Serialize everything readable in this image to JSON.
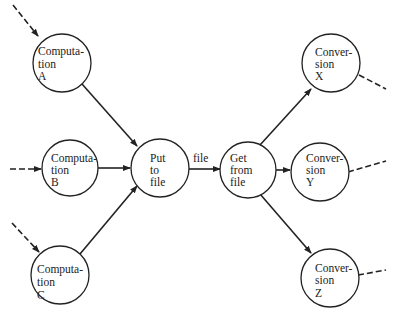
{
  "diagram": {
    "nodes": [
      {
        "id": "compA",
        "lines": [
          "Computa-",
          "tion",
          "A"
        ],
        "cx": 62,
        "cy": 63
      },
      {
        "id": "compB",
        "lines": [
          "Computa-",
          "tion",
          "B"
        ],
        "cx": 70,
        "cy": 165
      },
      {
        "id": "compC",
        "lines": [
          "Computa-",
          "tion",
          "C"
        ],
        "cx": 60,
        "cy": 275
      },
      {
        "id": "put",
        "lines": [
          "Put",
          "to",
          "file"
        ],
        "cx": 160,
        "cy": 165
      },
      {
        "id": "get",
        "lines": [
          "Get",
          "from",
          "file"
        ],
        "cx": 250,
        "cy": 168
      },
      {
        "id": "convX",
        "lines": [
          "Conver-",
          "sion",
          "X"
        ],
        "cx": 331,
        "cy": 63
      },
      {
        "id": "convY",
        "lines": [
          "Conver-",
          "sion",
          "Y"
        ],
        "cx": 320,
        "cy": 172
      },
      {
        "id": "convZ",
        "lines": [
          "Conver-",
          "sion",
          "Z"
        ],
        "cx": 330,
        "cy": 276
      }
    ],
    "edges": [
      {
        "from": "compA",
        "to": "put",
        "style": "solid"
      },
      {
        "from": "compB",
        "to": "put",
        "style": "solid"
      },
      {
        "from": "compC",
        "to": "put",
        "style": "solid"
      },
      {
        "from": "put",
        "to": "get",
        "style": "solid",
        "label": "file"
      },
      {
        "from": "get",
        "to": "convX",
        "style": "solid"
      },
      {
        "from": "get",
        "to": "convY",
        "style": "solid"
      },
      {
        "from": "get",
        "to": "convZ",
        "style": "solid"
      }
    ],
    "edge_label_file": "file"
  }
}
